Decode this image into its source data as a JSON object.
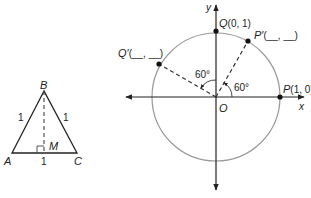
{
  "triangle": {
    "vertices": {
      "A": "A",
      "B": "B",
      "C": "C",
      "M": "M"
    },
    "side_labels": {
      "AB": "1",
      "BC": "1",
      "AC": "1"
    },
    "altitude": "BM",
    "right_angle_at": "M"
  },
  "unit_circle": {
    "axis_labels": {
      "x": "x",
      "y": "y"
    },
    "origin_label": "O",
    "points": {
      "P": {
        "name": "P",
        "coords": "(1, 0)"
      },
      "Q": {
        "name": "Q",
        "coords": "(0, 1)"
      },
      "P_prime": {
        "name": "P′",
        "coords": "(__, __)"
      },
      "Q_prime": {
        "name": "Q′",
        "coords": "(__, __)"
      }
    },
    "angles": {
      "P_to_Pprime": "60°",
      "Q_to_Qprime": "60°"
    }
  },
  "colors": {
    "circle": "#999999",
    "axis": "#222222",
    "text": "#222222"
  }
}
